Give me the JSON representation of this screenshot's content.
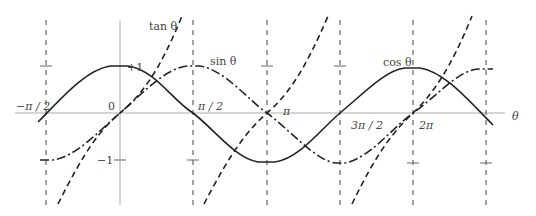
{
  "diagram": {
    "axis_label": "θ",
    "x_ticks": [
      "−π / 2",
      "0",
      "π / 2",
      "π",
      "3π / 2",
      "2π"
    ],
    "y_ticks": [
      "+1",
      "−1"
    ],
    "curves": [
      {
        "name": "sin θ",
        "label": "sin θ",
        "style": "dash-dot"
      },
      {
        "name": "cos θ",
        "label": "cos θ",
        "style": "solid"
      },
      {
        "name": "tan θ",
        "label": "tan θ",
        "style": "dashed"
      }
    ],
    "x_range": [
      "−π/2 − ε",
      "5π/2 + ε"
    ],
    "asymptotes": [
      "−π/2",
      "π/2",
      "3π/2",
      "5π/2"
    ],
    "colors": {
      "curve": "#222222",
      "axis": "#999999",
      "grid": "#555555"
    }
  }
}
